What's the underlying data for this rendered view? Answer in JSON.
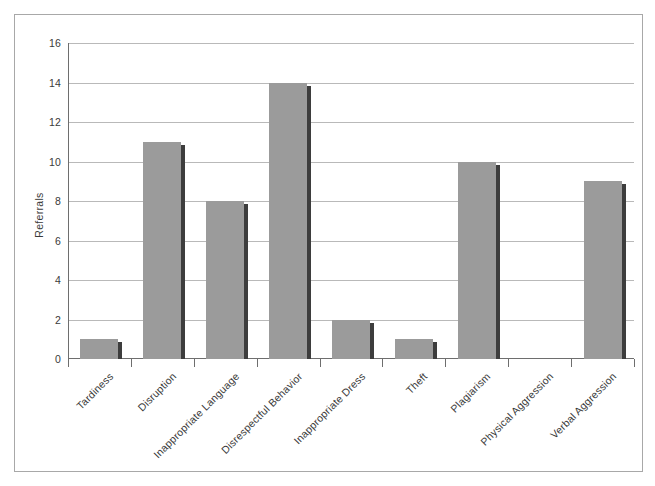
{
  "chart_data": {
    "type": "bar",
    "title": "",
    "xlabel": "",
    "ylabel": "Referrals",
    "ylim": [
      0,
      16
    ],
    "yticks": [
      0,
      2,
      4,
      6,
      8,
      10,
      12,
      14,
      16
    ],
    "grid": true,
    "legend": "none",
    "categories": [
      "Tardiness",
      "Disruption",
      "Inappropriate Language",
      "Disrespectful Behavior",
      "Inappropriate Dress",
      "Theft",
      "Plagiarism",
      "Physical Aggression",
      "Verbal Aggression"
    ],
    "values": [
      1,
      11,
      8,
      14,
      2,
      1,
      10,
      0,
      9
    ],
    "bar_color": "#9b9b9b",
    "bar_shadow_color": "#3d3d3d",
    "gridline_color": "#b9b9b9",
    "axis_color": "#6e6e6e",
    "frame_color": "#a8a8a8",
    "background_color": "#ffffff"
  }
}
